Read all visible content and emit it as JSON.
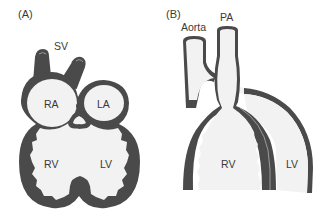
{
  "figure": {
    "panels": [
      {
        "id": "A",
        "label": "(A)",
        "structures": {
          "sv": "SV",
          "ra": "RA",
          "la": "LA",
          "rv": "RV",
          "lv": "LV"
        }
      },
      {
        "id": "B",
        "label": "(B)",
        "structures": {
          "aorta": "Aorta",
          "pa": "PA",
          "rv": "RV",
          "lv": "LV"
        }
      }
    ],
    "colors": {
      "wall": "#4a4a4a",
      "lumen": "#f2f2f2",
      "background": "#ffffff",
      "text": "#3a3a3a"
    }
  }
}
